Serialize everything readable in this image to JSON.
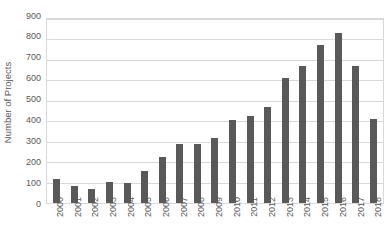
{
  "chart_data": {
    "type": "bar",
    "title": "",
    "subtitle": "",
    "xlabel": "",
    "ylabel": "Number of Projects",
    "categories": [
      "2000",
      "2001",
      "2002",
      "2003",
      "2004",
      "2005",
      "2006",
      "2007",
      "2008",
      "2009",
      "2010",
      "2011",
      "2012",
      "2013",
      "2014",
      "2015",
      "2016",
      "2017",
      "2018"
    ],
    "values": [
      118,
      85,
      70,
      105,
      100,
      158,
      227,
      291,
      291,
      316,
      406,
      428,
      472,
      612,
      668,
      775,
      832,
      672,
      412
    ],
    "ylim": [
      0,
      900
    ],
    "ytick_values": [
      0,
      100,
      200,
      300,
      400,
      500,
      600,
      700,
      800,
      900
    ],
    "ytick_labels": [
      "0",
      "100",
      "200",
      "300",
      "400",
      "500",
      "600",
      "700",
      "800",
      "900"
    ],
    "grid": true,
    "grid_axis": "y",
    "legend": false,
    "legend_position": "none",
    "bar_color": "#595959",
    "grid_color": "#d9d9d9",
    "plot_border_color": "#d9d9d9",
    "background_color": "#ffffff",
    "text_color": "#595959",
    "xtick_rotation": 90
  }
}
